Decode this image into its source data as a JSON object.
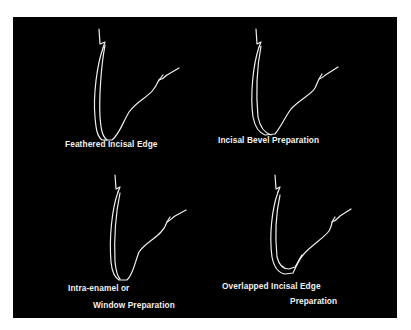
{
  "figure": {
    "background_color": "#000000",
    "line_color": "#f0f0f0",
    "panels": [
      {
        "id": "feathered",
        "label_lines": [
          "Feathered Incisal Edge"
        ]
      },
      {
        "id": "bevel",
        "label_lines": [
          "Incisal Bevel Preparation"
        ]
      },
      {
        "id": "window",
        "label_lines": [
          "Intra-enamel or",
          "Window Preparation"
        ]
      },
      {
        "id": "overlapped",
        "label_lines": [
          "Overlapped Incisal Edge",
          "Preparation"
        ]
      }
    ]
  }
}
